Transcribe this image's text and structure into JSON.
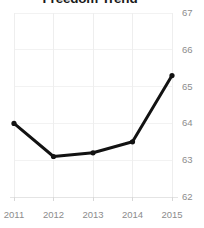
{
  "chart_data": {
    "type": "line",
    "title": "Freedom Trend",
    "xlabel": "",
    "ylabel": "",
    "x": [
      "2011",
      "2012",
      "2013",
      "2014",
      "2015"
    ],
    "categories": [
      "2011",
      "2012",
      "2013",
      "2014",
      "2015"
    ],
    "values": [
      64.0,
      63.1,
      63.2,
      63.5,
      65.3
    ],
    "series": [
      {
        "name": "Freedom Score",
        "values": [
          64.0,
          63.1,
          63.2,
          63.5,
          65.3
        ]
      }
    ],
    "xtick_labels": [
      "2011",
      "2012",
      "2013",
      "2014",
      "2015"
    ],
    "ytick_labels": [
      "67",
      "66",
      "65",
      "64",
      "63",
      "62"
    ],
    "ytick_values": [
      67,
      66,
      65,
      64,
      63,
      62
    ],
    "ylim": [
      62,
      67
    ],
    "grid": true,
    "legend": "none",
    "yaxis_position": "right",
    "line_color": "#121212",
    "grid_color": "#f2f2f2",
    "label_color": "#8c8c8c",
    "title_color": "#1a1a1a",
    "background": "#ffffff"
  }
}
